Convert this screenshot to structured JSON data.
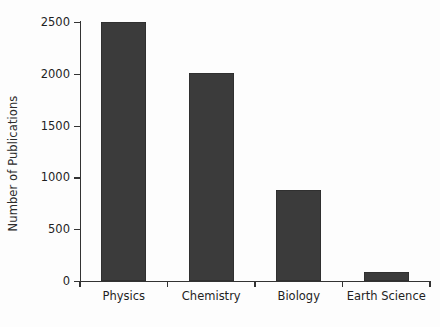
{
  "chart_data": {
    "type": "bar",
    "title": "",
    "xlabel": "",
    "ylabel": "Number of Publications",
    "categories": [
      "Physics",
      "Chemistry",
      "Biology",
      "Earth Science"
    ],
    "values": [
      2500,
      2010,
      880,
      90
    ],
    "ylim": [
      0,
      2500
    ],
    "yticks": [
      0,
      500,
      1000,
      1500,
      2000,
      2500
    ],
    "ytick_labels": [
      "0",
      "500",
      "1000",
      "1500",
      "2000",
      "2500"
    ],
    "grid": false,
    "legend": null,
    "bar_color": "#3b3b3b",
    "axis_color": "#333333",
    "background_color": "#fdfdfd",
    "series": [
      {
        "name": "Number of Publications",
        "values": [
          2500,
          2010,
          880,
          90
        ]
      }
    ]
  }
}
